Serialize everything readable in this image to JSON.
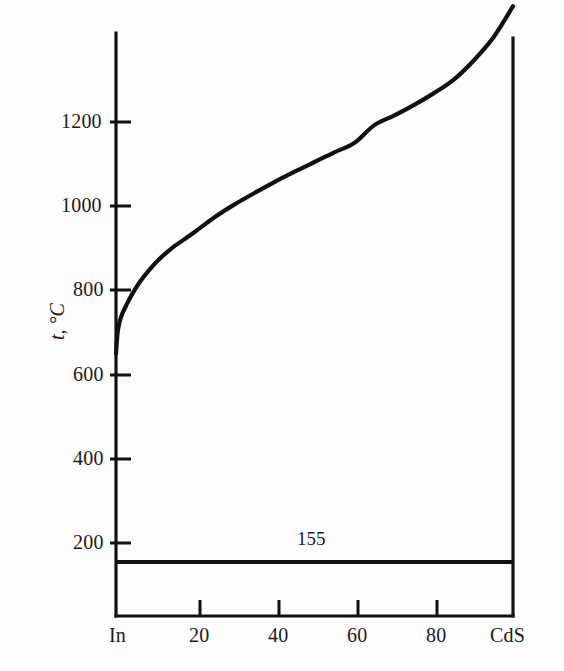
{
  "figure": {
    "background_color": "#fdfdfd",
    "line_color": "#111111",
    "axis_color": "#111111"
  },
  "axes": {
    "y_axis_label": "t, °C",
    "y_ticks": [
      "1200",
      "1000",
      "800",
      "600",
      "400",
      "200"
    ],
    "x_ticks": [
      "In",
      "20",
      "40",
      "60",
      "80",
      "CdS"
    ]
  },
  "annotations": {
    "eutectic_temp_label": "155"
  },
  "chart_data": {
    "type": "line",
    "title": "",
    "xlabel": "",
    "ylabel": "t, °C",
    "xlim": [
      0,
      100
    ],
    "ylim": [
      0,
      1480
    ],
    "grid": false,
    "legend": "none",
    "x_tick_values": [
      0,
      20,
      40,
      60,
      80,
      100
    ],
    "x_tick_labels": [
      "In",
      "20",
      "40",
      "60",
      "80",
      "CdS"
    ],
    "y_tick_values": [
      200,
      400,
      600,
      800,
      1000,
      1200
    ],
    "y_tick_labels": [
      "200",
      "400",
      "600",
      "800",
      "1000",
      "1200"
    ],
    "series": [
      {
        "name": "liquidus",
        "x": [
          0.0,
          0.4,
          0.9,
          1.6,
          2.6,
          4.0,
          6.0,
          8.5,
          11.0,
          14.0,
          17.0,
          20.0,
          25.0,
          30.0,
          35.0,
          40.0,
          45.0,
          50.0,
          55.0,
          60.0,
          65.0,
          70.0,
          75.0,
          80.0,
          85.0,
          90.0,
          95.0,
          100.0
        ],
        "y": [
          650,
          700,
          725,
          745,
          765,
          790,
          820,
          850,
          875,
          900,
          920,
          940,
          975,
          1005,
          1032,
          1058,
          1082,
          1105,
          1128,
          1150,
          1192,
          1215,
          1240,
          1268,
          1300,
          1345,
          1400,
          1475
        ]
      },
      {
        "name": "eutectic-horizontal",
        "x": [
          0,
          100
        ],
        "y": [
          155,
          155
        ]
      }
    ],
    "annotations": [
      {
        "text": "155",
        "x": 50,
        "y": 205
      }
    ]
  }
}
